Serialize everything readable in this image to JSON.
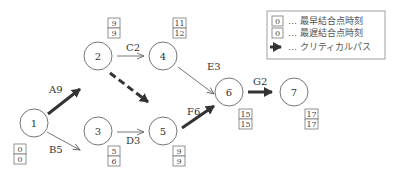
{
  "nodes": [
    {
      "id": "1",
      "earliest": "0",
      "latest": "0"
    },
    {
      "id": "2",
      "earliest": "9",
      "latest": "9"
    },
    {
      "id": "3",
      "earliest": "5",
      "latest": "6"
    },
    {
      "id": "4",
      "earliest": "11",
      "latest": "12"
    },
    {
      "id": "5",
      "earliest": "9",
      "latest": "9"
    },
    {
      "id": "6",
      "earliest": "15",
      "latest": "15"
    },
    {
      "id": "7",
      "earliest": "17",
      "latest": "17"
    }
  ],
  "edges": [
    {
      "label": "A9",
      "from": "1",
      "to": "2",
      "critical": true
    },
    {
      "label": "B5",
      "from": "1",
      "to": "3",
      "critical": false
    },
    {
      "label": "C2",
      "from": "2",
      "to": "4",
      "critical": false
    },
    {
      "label": "",
      "from": "2",
      "to": "5",
      "critical": true,
      "dummy": true
    },
    {
      "label": "D3",
      "from": "3",
      "to": "5",
      "critical": false
    },
    {
      "label": "E3",
      "from": "4",
      "to": "6",
      "critical": false
    },
    {
      "label": "F6",
      "from": "5",
      "to": "6",
      "critical": true
    },
    {
      "label": "G2",
      "from": "6",
      "to": "7",
      "critical": true
    }
  ],
  "legend": {
    "sample_value_1": "0",
    "sample_value_2": "0",
    "earliest_label": "… 最早結合点時刻",
    "latest_label": "… 最遅結合点時刻",
    "critical_label": "… クリティカルパス"
  }
}
